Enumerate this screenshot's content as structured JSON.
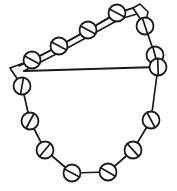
{
  "figure": {
    "width": 177,
    "height": 191,
    "colors": {
      "background": "#ffffff",
      "ink": "#1a1a1a"
    },
    "bead_count": 16,
    "bead_radius": 8.5,
    "chain_outline_points": "10,68 22,86 30,121 45,150 72,173 108,172 133,150 151,120 158,67 155,55 145,26 133,8 117,13 88,30 59,46 32,60 10,68",
    "rail_upper_points": "133,8 117,13 88,30 59,46 32,60 19,66",
    "rail_lower_points": "137,14 120,19 91,35 62,51 35,65 24,71",
    "rail_right_points": "133,8 140,4 148,12 145,26",
    "chord_points": "24,71 158,67",
    "beads": [
      {
        "name": "bead-top-apex",
        "cx": 117,
        "cy": 13,
        "slash": 28
      },
      {
        "name": "bead-upper-right",
        "cx": 145,
        "cy": 26,
        "slash": 72
      },
      {
        "name": "bead-right-upper",
        "cx": 155,
        "cy": 55,
        "slash": 75
      },
      {
        "name": "bead-right-chord",
        "cx": 158,
        "cy": 67,
        "slash": 88
      },
      {
        "name": "bead-right-mid",
        "cx": 151,
        "cy": 120,
        "slash": 62
      },
      {
        "name": "bead-right-lower",
        "cx": 133,
        "cy": 150,
        "slash": 48
      },
      {
        "name": "bead-bottom-right",
        "cx": 108,
        "cy": 172,
        "slash": 30
      },
      {
        "name": "bead-bottom-left",
        "cx": 72,
        "cy": 173,
        "slash": 28
      },
      {
        "name": "bead-left-lower",
        "cx": 45,
        "cy": 150,
        "slash": 130
      },
      {
        "name": "bead-left-mid",
        "cx": 30,
        "cy": 121,
        "slash": 118
      },
      {
        "name": "bead-left-upper",
        "cx": 22,
        "cy": 86,
        "slash": 100
      },
      {
        "name": "bead-left-rail-end",
        "cx": 32,
        "cy": 60,
        "slash": 28
      },
      {
        "name": "bead-rail-1",
        "cx": 59,
        "cy": 46,
        "slash": 28
      },
      {
        "name": "bead-rail-2",
        "cx": 88,
        "cy": 30,
        "slash": 28
      },
      {
        "name": "bead-rail-3",
        "cx": 117,
        "cy": 13,
        "slash": 28
      },
      {
        "name": "bead-notch-right",
        "cx": 145,
        "cy": 26,
        "slash": 72
      }
    ]
  }
}
